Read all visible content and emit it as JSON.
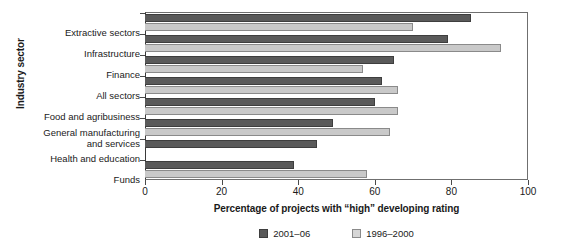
{
  "chart_data": {
    "type": "bar",
    "orientation": "horizontal",
    "title": "",
    "xlabel": "Percentage of projects with “high” developing rating",
    "ylabel": "Industry sector",
    "xlim": [
      0,
      100
    ],
    "xticks": [
      0,
      20,
      40,
      60,
      80,
      100
    ],
    "xtick_labels": [
      "0",
      "20",
      "40",
      "60",
      "80",
      "100"
    ],
    "grid": false,
    "legend_position": "bottom-center",
    "categories": [
      "Extractive sectors",
      "Infrastructure",
      "Finance",
      "All sectors",
      "Food and agribusiness",
      "General manufacturing\nand services",
      "Health and education",
      "Funds"
    ],
    "series": [
      {
        "name": "2001–06",
        "color": "#5a5a5a",
        "values": [
          85,
          79,
          65,
          62,
          60,
          49,
          45,
          39
        ]
      },
      {
        "name": "1996–2000",
        "color": "#c9c9c9",
        "values": [
          70,
          93,
          57,
          66,
          66,
          64,
          null,
          58
        ]
      }
    ]
  },
  "axis": {
    "y_title": "Industry sector",
    "x_title": "Percentage of projects with “high” developing rating"
  },
  "legend": {
    "items": [
      {
        "label": "2001–06"
      },
      {
        "label": "1996–2000"
      }
    ]
  }
}
